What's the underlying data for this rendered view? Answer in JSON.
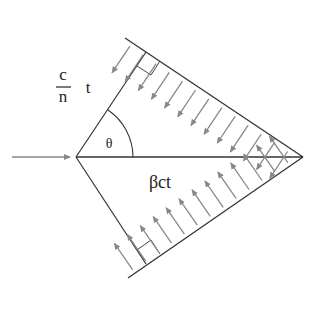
{
  "diagram": {
    "labels": {
      "c": "c",
      "n": "n",
      "t": "t",
      "theta": "θ",
      "beta_ct": "βct"
    },
    "colors": {
      "line": "#333333",
      "arrow": "#888888",
      "background": "#ffffff"
    },
    "geometry": {
      "origin": [
        76,
        157
      ],
      "apex": [
        303,
        157
      ],
      "upper_front_start": [
        125,
        38
      ],
      "lower_front_start": [
        128,
        278
      ],
      "upper_foot": [
        146,
        52
      ],
      "lower_foot": [
        146,
        264
      ]
    },
    "arrow_counts": {
      "upper": 13,
      "lower": 13
    }
  }
}
